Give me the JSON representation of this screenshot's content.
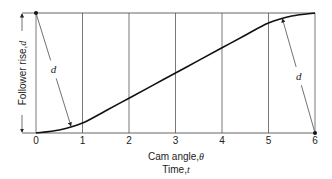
{
  "chart_data": {
    "type": "line",
    "title": "",
    "xlabel_line1": "Cam angle,",
    "xlabel_symbol1": "θ",
    "xlabel_line2": "Time,",
    "xlabel_symbol2": "t",
    "ylabel": "Follower rise,",
    "ylabel_symbol": "d",
    "x_ticks": [
      "0",
      "1",
      "2",
      "3",
      "4",
      "5",
      "6"
    ],
    "xlim": [
      0,
      6
    ],
    "ylim": [
      0,
      1
    ],
    "grid": "vertical",
    "series": [
      {
        "name": "follower displacement",
        "x": [
          0,
          0.5,
          1,
          1.5,
          2,
          2.5,
          3,
          3.5,
          4,
          4.5,
          5,
          5.5,
          6
        ],
        "y": [
          0,
          0.025,
          0.083,
          0.185,
          0.29,
          0.395,
          0.5,
          0.605,
          0.71,
          0.815,
          0.917,
          0.975,
          1
        ]
      }
    ],
    "annotations": [
      {
        "label": "d",
        "from": [
          0,
          1
        ],
        "to": [
          0.75,
          0.06
        ]
      },
      {
        "label": "d",
        "from": [
          6,
          0
        ],
        "to": [
          5.3,
          0.95
        ]
      }
    ]
  }
}
